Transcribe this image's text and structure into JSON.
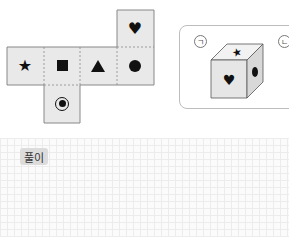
{
  "net": {
    "faces": [
      {
        "id": "top-right",
        "symbol": "♥",
        "icon": "heart-icon"
      },
      {
        "id": "row-1",
        "symbol": "★",
        "icon": "star-icon"
      },
      {
        "id": "row-2",
        "symbol": "■",
        "icon": "square-icon"
      },
      {
        "id": "row-3",
        "symbol": "▲",
        "icon": "triangle-icon"
      },
      {
        "id": "row-4",
        "symbol": "●",
        "icon": "circle-icon"
      },
      {
        "id": "bottom",
        "symbol": "◉",
        "icon": "target-icon"
      }
    ]
  },
  "choices": [
    {
      "label": "ㄱ",
      "cube": {
        "top": "★",
        "front": "♥",
        "side": "●"
      }
    },
    {
      "label": "ㄴ"
    }
  ],
  "solution": {
    "label": "풀이"
  },
  "colors": {
    "face": "#e9e9e9",
    "border": "#888888",
    "grid": "#ececec"
  }
}
